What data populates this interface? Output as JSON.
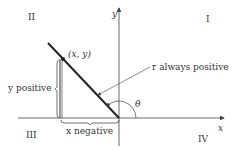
{
  "quadrants": {
    "q1": "I",
    "q2": "II",
    "q3": "III",
    "q4": "IV"
  },
  "axes": {
    "x_label": "x",
    "y_label": "y"
  },
  "point_label": "(x, y)",
  "r_label": "r always positive",
  "angle_label": "θ",
  "y_brace_label": "y positive",
  "x_brace_label": "x negative",
  "colors": {
    "line": "#222222",
    "text": "#333333",
    "axis": "#444444"
  }
}
